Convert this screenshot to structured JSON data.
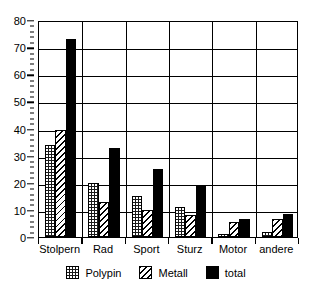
{
  "chart_data": {
    "type": "bar",
    "title": "",
    "xlabel": "",
    "ylabel": "",
    "categories": [
      "Stolpern",
      "Rad",
      "Sport",
      "Sturz",
      "Motor",
      "andere"
    ],
    "series": [
      {
        "name": "Polypin",
        "pattern": "dotted",
        "values": [
          34,
          20,
          15,
          11,
          1,
          2
        ]
      },
      {
        "name": "Metall",
        "pattern": "hatched",
        "values": [
          39.5,
          13,
          10,
          8,
          5.5,
          6.5
        ]
      },
      {
        "name": "total",
        "pattern": "solid",
        "values": [
          73,
          33,
          25,
          19,
          6.5,
          8.5
        ]
      }
    ],
    "ylim": [
      0,
      80
    ],
    "ytick_labels": [
      "0",
      "10",
      "20",
      "30",
      "40",
      "50",
      "60",
      "70",
      "80"
    ],
    "ytick_values": [
      0,
      10,
      20,
      30,
      40,
      50,
      60,
      70,
      80
    ],
    "yminor_step": 2,
    "grid": "horizontal-and-group-separators",
    "legend_position": "bottom-center",
    "colors": {
      "ink": "#000000",
      "background": "#ffffff"
    }
  },
  "legend": {
    "entries": [
      {
        "label": "Polypin"
      },
      {
        "label": "Metall"
      },
      {
        "label": "total"
      }
    ]
  }
}
